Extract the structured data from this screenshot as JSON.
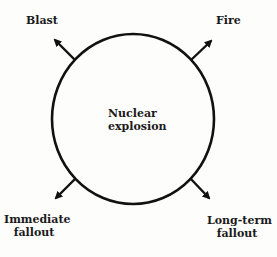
{
  "diagram": {
    "center": {
      "label_line1": "Nuclear",
      "label_line2": "explosion"
    },
    "effects": [
      {
        "label_line1": "Blast",
        "label_line2": "",
        "direction": "up-left"
      },
      {
        "label_line1": "Fire",
        "label_line2": "",
        "direction": "up-right"
      },
      {
        "label_line1": "Immediate",
        "label_line2": "fallout",
        "direction": "down-left"
      },
      {
        "label_line1": "Long-term",
        "label_line2": "fallout",
        "direction": "down-right"
      }
    ],
    "colors": {
      "stroke": "#111111",
      "background": "#fdfdfc"
    }
  }
}
